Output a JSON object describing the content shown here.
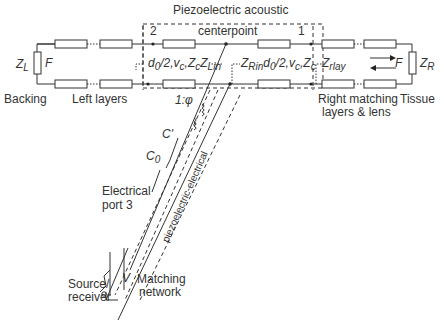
{
  "diagram": {
    "title": "Piezoelectric acoustic",
    "centerpoint_label": "centerpoint",
    "port_labels": {
      "port2": "2",
      "port1": "1"
    },
    "left_section": {
      "impedance_label": "Z",
      "impedance_sub": "L",
      "force_label": "F",
      "backing_label": "Backing",
      "layers_label": "Left layers"
    },
    "center_section": {
      "left_params": {
        "d": "d",
        "d_sub": "0",
        "rest": "/2,v",
        "v_sub": "c",
        "z": ",Z",
        "z_sub": "c",
        "zl": "Z",
        "zl_sub": "Lin"
      },
      "right_params": {
        "zr": "Z",
        "zr_sub": "Rin",
        "d": "d",
        "d_sub": "0",
        "rest": "/2,v",
        "v_sub": "c",
        "z": ",Z",
        "z_sub": "c"
      }
    },
    "right_section": {
      "z_lay": "Z",
      "z_lay_sub": "rlay",
      "force_label": "F",
      "impedance_label": "Z",
      "impedance_sub": "R",
      "matching_label_line1": "Right matching",
      "matching_label_line2": "layers & lens",
      "tissue_label": "Tissue"
    },
    "electrical": {
      "transformer_ratio": "1:φ",
      "c_prime": "C'",
      "c0": "C",
      "c0_sub": "0",
      "port_label_line1": "Electrical",
      "port_label_line2": "port 3",
      "diagonal_text": "piezoelectric-electrical",
      "voltage_label": "V",
      "voltage_small": "v",
      "source_line1": "Source/",
      "source_line2": "receiver",
      "matching_line1": "Matching",
      "matching_line2": "network"
    }
  }
}
